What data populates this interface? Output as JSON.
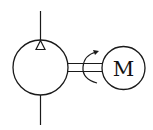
{
  "diagram": {
    "type": "hydraulic-schematic",
    "stroke_color": "#1a1a1a",
    "background": "#ffffff",
    "components": {
      "pump": {
        "symbol": "pump-circle",
        "flow_indicator": "triangle-outlet"
      },
      "shaft": {
        "symbol": "double-line-shaft",
        "rotation": "curved-arrow"
      },
      "motor": {
        "symbol": "motor-circle",
        "label": "M"
      }
    },
    "lines": {
      "inlet": "bottom-port-line",
      "outlet": "top-port-line"
    }
  }
}
